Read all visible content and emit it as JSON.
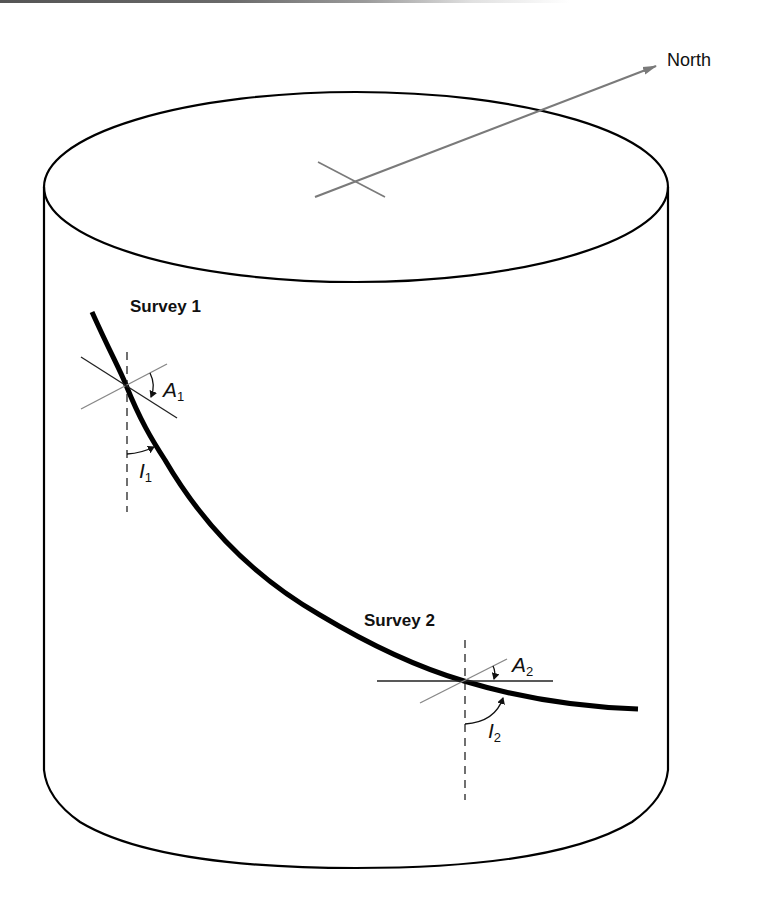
{
  "diagram": {
    "type": "directional-survey-cylinder",
    "north_label": "North",
    "surveys": [
      {
        "label": "Survey 1",
        "azimuth_symbol": "A",
        "azimuth_sub": "1",
        "inclination_symbol": "I",
        "inclination_sub": "1"
      },
      {
        "label": "Survey 2",
        "azimuth_symbol": "A",
        "azimuth_sub": "2",
        "inclination_symbol": "I",
        "inclination_sub": "2"
      }
    ],
    "colors": {
      "outline": "#000000",
      "wellpath": "#000000",
      "north_arrow": "#7a7a7a",
      "reference_lines": "#888888",
      "background": "#ffffff"
    }
  }
}
